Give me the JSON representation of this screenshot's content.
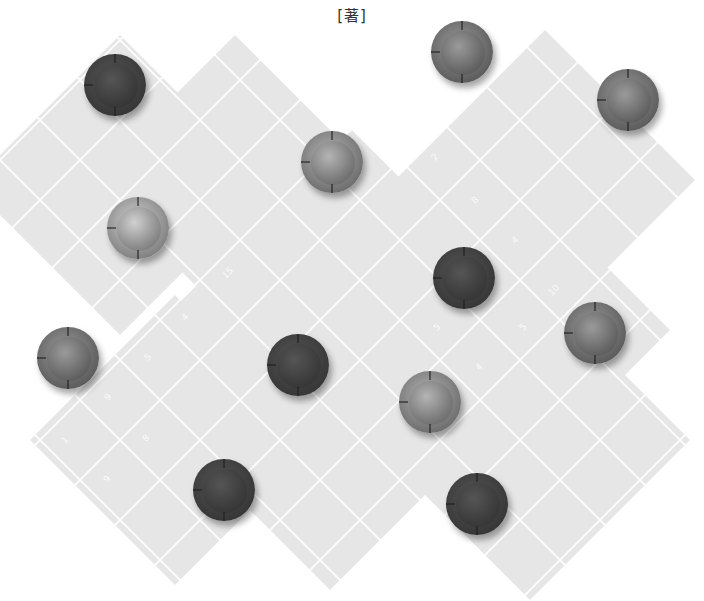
{
  "title": "[著]",
  "board": {
    "background": "#e6e6e6",
    "grid_line_color": "#ffffff",
    "cell_spacing": 40,
    "regions": [
      {
        "name": "top-left-diamond",
        "cx": 120,
        "cy": 185,
        "r": 150
      },
      {
        "name": "top-mid-diamond",
        "cx": 235,
        "cy": 180,
        "r": 145
      },
      {
        "name": "top-right-diamond",
        "cx": 545,
        "cy": 180,
        "r": 150
      },
      {
        "name": "right-mid-diamond",
        "cx": 560,
        "cy": 330,
        "r": 110
      },
      {
        "name": "center-band",
        "cx": 352,
        "cy": 320,
        "r": 190
      },
      {
        "name": "bottom-left-diamond",
        "cx": 175,
        "cy": 440,
        "r": 145
      },
      {
        "name": "bottom-mid-diamond",
        "cx": 330,
        "cy": 450,
        "r": 140
      },
      {
        "name": "bottom-right-diamond",
        "cx": 530,
        "cy": 440,
        "r": 160
      }
    ]
  },
  "coordinates": [
    {
      "label": "12",
      "x": 392,
      "y": 118
    },
    {
      "label": "2",
      "x": 432,
      "y": 152
    },
    {
      "label": "8",
      "x": 472,
      "y": 195
    },
    {
      "label": "4",
      "x": 512,
      "y": 235
    },
    {
      "label": "15",
      "x": 222,
      "y": 268
    },
    {
      "label": "4",
      "x": 182,
      "y": 312
    },
    {
      "label": "5",
      "x": 145,
      "y": 352
    },
    {
      "label": "9",
      "x": 105,
      "y": 392
    },
    {
      "label": "1",
      "x": 62,
      "y": 435
    },
    {
      "label": "8",
      "x": 143,
      "y": 433
    },
    {
      "label": "9",
      "x": 104,
      "y": 474
    },
    {
      "label": "10",
      "x": 64,
      "y": 515
    },
    {
      "label": "10",
      "x": 548,
      "y": 285
    },
    {
      "label": "5",
      "x": 434,
      "y": 322
    },
    {
      "label": "5",
      "x": 520,
      "y": 322
    },
    {
      "label": "4",
      "x": 476,
      "y": 362
    }
  ],
  "pieces": [
    {
      "id": 1,
      "x": 115,
      "y": 85,
      "shade": "dark"
    },
    {
      "id": 2,
      "x": 462,
      "y": 52,
      "shade": "medium"
    },
    {
      "id": 3,
      "x": 628,
      "y": 100,
      "shade": "medium"
    },
    {
      "id": 4,
      "x": 332,
      "y": 162,
      "shade": "medium-light"
    },
    {
      "id": 5,
      "x": 138,
      "y": 228,
      "shade": "light"
    },
    {
      "id": 6,
      "x": 464,
      "y": 278,
      "shade": "dark"
    },
    {
      "id": 7,
      "x": 68,
      "y": 358,
      "shade": "medium"
    },
    {
      "id": 8,
      "x": 298,
      "y": 365,
      "shade": "dark"
    },
    {
      "id": 9,
      "x": 595,
      "y": 333,
      "shade": "medium"
    },
    {
      "id": 10,
      "x": 430,
      "y": 402,
      "shade": "medium-light"
    },
    {
      "id": 11,
      "x": 224,
      "y": 490,
      "shade": "dark"
    },
    {
      "id": 12,
      "x": 477,
      "y": 504,
      "shade": "dark"
    }
  ],
  "shades": {
    "dark": {
      "outer": "#2e2e2e",
      "inner": "#3c3c3c",
      "hi": "#555555"
    },
    "medium": {
      "outer": "#4a4a4a",
      "inner": "#6a6a6a",
      "hi": "#9a9a9a"
    },
    "medium-light": {
      "outer": "#5a5a5a",
      "inner": "#7c7c7c",
      "hi": "#b4b4b4"
    },
    "light": {
      "outer": "#6a6a6a",
      "inner": "#8f8f8f",
      "hi": "#d0d0d0"
    }
  }
}
